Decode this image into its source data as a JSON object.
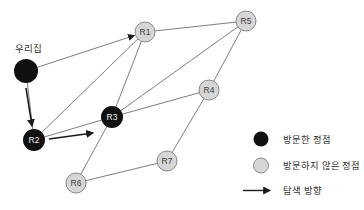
{
  "colors": {
    "background": "#ffffff",
    "visited_fill": "#111111",
    "unvisited_fill": "#d6d6d6",
    "unvisited_stroke": "#8a8a8a",
    "edge": "#6e6e6e",
    "arrow": "#1a1a1a",
    "label_on_gray": "#3a3a3a",
    "label_on_black": "#f2f2f2",
    "legend_text": "#2e2e2e"
  },
  "graph": {
    "nodes": [
      {
        "id": "home",
        "label": "우리집",
        "x": 26,
        "y": 71,
        "r": 12,
        "state": "visited",
        "label_outside": true,
        "label_x": 28,
        "label_y": 52
      },
      {
        "id": "R1",
        "label": "R1",
        "x": 145,
        "y": 32,
        "r": 10,
        "state": "unvisited"
      },
      {
        "id": "R5",
        "label": "R5",
        "x": 246,
        "y": 21,
        "r": 10,
        "state": "unvisited"
      },
      {
        "id": "R4",
        "label": "R4",
        "x": 209,
        "y": 90,
        "r": 10,
        "state": "unvisited"
      },
      {
        "id": "R3",
        "label": "R3",
        "x": 112,
        "y": 117,
        "r": 11,
        "state": "visited"
      },
      {
        "id": "R2",
        "label": "R2",
        "x": 34,
        "y": 140,
        "r": 11,
        "state": "visited"
      },
      {
        "id": "R6",
        "label": "R6",
        "x": 76,
        "y": 183,
        "r": 10,
        "state": "unvisited"
      },
      {
        "id": "R7",
        "label": "R7",
        "x": 167,
        "y": 161,
        "r": 10,
        "state": "unvisited"
      }
    ],
    "edges": [
      {
        "from": "home",
        "to": "R1",
        "directed": true
      },
      {
        "from": "home",
        "to": "R2"
      },
      {
        "from": "R1",
        "to": "R2"
      },
      {
        "from": "R1",
        "to": "R3"
      },
      {
        "from": "R1",
        "to": "R5"
      },
      {
        "from": "R2",
        "to": "R3"
      },
      {
        "from": "R3",
        "to": "R4"
      },
      {
        "from": "R3",
        "to": "R5"
      },
      {
        "from": "R3",
        "to": "R6"
      },
      {
        "from": "R4",
        "to": "R5"
      },
      {
        "from": "R4",
        "to": "R7"
      },
      {
        "from": "R6",
        "to": "R7"
      }
    ],
    "direction_arrows": [
      {
        "from": "home",
        "to": "R2",
        "x1": 26,
        "y1": 88,
        "x2": 32,
        "y2": 126
      },
      {
        "from": "R2",
        "to": "R3",
        "x1": 49,
        "y1": 139,
        "x2": 93,
        "y2": 133
      }
    ]
  },
  "legend": {
    "visited_label": "방문한 정점",
    "unvisited_label": "방문하지 않은 정점",
    "direction_label": "탐색 방향"
  }
}
